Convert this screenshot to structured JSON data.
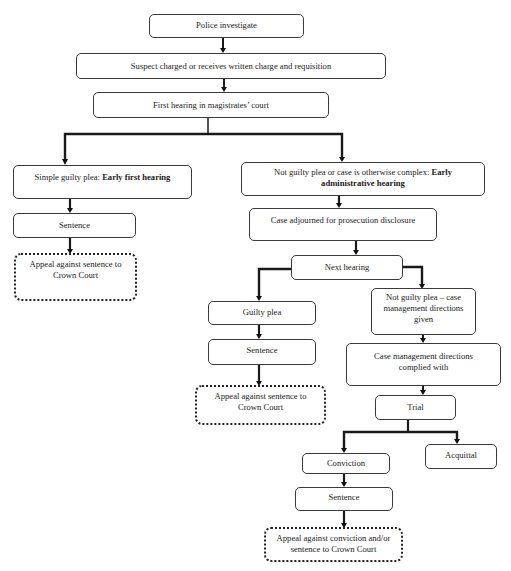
{
  "diagram": {
    "type": "flowchart",
    "title": "",
    "nodes": {
      "police_investigate": {
        "label": "Police investigate"
      },
      "suspect_charged": {
        "label": "Suspect charged or receives written charge and requisition"
      },
      "first_hearing": {
        "label": "First hearing in magistrates’ court"
      },
      "simple_guilty": {
        "label_prefix": "Simple guilty plea: ",
        "label_bold": "Early first hearing"
      },
      "not_guilty_complex": {
        "label_prefix": "Not guilty plea or case is otherwise complex: ",
        "label_bold": "Early administrative hearing"
      },
      "sentence_left": {
        "label": "Sentence"
      },
      "appeal_left": {
        "label": "Appeal against sentence to Crown Court"
      },
      "case_adjourned": {
        "label": "Case adjourned for prosecution disclosure"
      },
      "next_hearing": {
        "label": "Next hearing"
      },
      "guilty_plea": {
        "label": "Guilty plea"
      },
      "not_guilty_cmd": {
        "label": "Not guilty plea – case management directions given"
      },
      "sentence_mid": {
        "label": "Sentence"
      },
      "cmd_complied": {
        "label": "Case management directions complied with"
      },
      "appeal_mid": {
        "label": "Appeal against sentence to Crown Court"
      },
      "trial": {
        "label": "Trial"
      },
      "conviction": {
        "label": "Conviction"
      },
      "acquittal": {
        "label": "Acquittal"
      },
      "sentence_bottom": {
        "label": "Sentence"
      },
      "appeal_bottom": {
        "label": "Appeal against conviction and/or sentence to Crown Court"
      }
    },
    "edges": [
      [
        "police_investigate",
        "suspect_charged"
      ],
      [
        "suspect_charged",
        "first_hearing"
      ],
      [
        "first_hearing",
        "simple_guilty"
      ],
      [
        "first_hearing",
        "not_guilty_complex"
      ],
      [
        "simple_guilty",
        "sentence_left"
      ],
      [
        "sentence_left",
        "appeal_left"
      ],
      [
        "not_guilty_complex",
        "case_adjourned"
      ],
      [
        "case_adjourned",
        "next_hearing"
      ],
      [
        "next_hearing",
        "guilty_plea"
      ],
      [
        "next_hearing",
        "not_guilty_cmd"
      ],
      [
        "guilty_plea",
        "sentence_mid"
      ],
      [
        "sentence_mid",
        "appeal_mid"
      ],
      [
        "not_guilty_cmd",
        "cmd_complied"
      ],
      [
        "cmd_complied",
        "trial"
      ],
      [
        "trial",
        "conviction"
      ],
      [
        "trial",
        "acquittal"
      ],
      [
        "conviction",
        "sentence_bottom"
      ],
      [
        "sentence_bottom",
        "appeal_bottom"
      ]
    ],
    "styles": {
      "appeal_nodes": "dotted-border",
      "line_color": "#222222"
    }
  }
}
